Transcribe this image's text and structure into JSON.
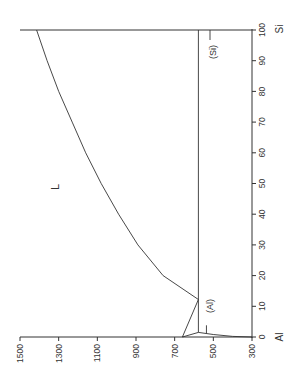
{
  "chart_data": {
    "type": "line",
    "orientation": "rotated 90° (temperature runs horizontally along bottom, composition vertically on right)",
    "xlabel": "Temperature (°C)",
    "ylabel": "Composition (at.% Si)",
    "temperature_axis": {
      "ticks": [
        1500,
        1300,
        1100,
        900,
        700,
        500,
        300
      ],
      "range": [
        300,
        1500
      ]
    },
    "composition_axis": {
      "ticks": [
        0,
        10,
        20,
        30,
        40,
        50,
        60,
        70,
        80,
        90,
        100
      ],
      "range": [
        0,
        100
      ],
      "end_labels": {
        "low": "Al",
        "high": "Si"
      }
    },
    "phase_labels": [
      "L",
      "(Al)",
      "(Si)"
    ],
    "series": [
      {
        "name": "Liquidus (Si side)",
        "points": [
          [
            100,
            1414
          ],
          [
            90,
            1360
          ],
          [
            80,
            1300
          ],
          [
            70,
            1230
          ],
          [
            60,
            1160
          ],
          [
            50,
            1080
          ],
          [
            40,
            990
          ],
          [
            30,
            890
          ],
          [
            20,
            760
          ],
          [
            12.2,
            577
          ]
        ]
      },
      {
        "name": "Liquidus (Al side)",
        "points": [
          [
            0,
            660
          ],
          [
            12.2,
            577
          ]
        ]
      },
      {
        "name": "Solidus (Al)",
        "points": [
          [
            0,
            660
          ],
          [
            1.5,
            577
          ]
        ]
      },
      {
        "name": "Eutectic isotherm",
        "points": [
          [
            1.5,
            577
          ],
          [
            100,
            577
          ]
        ]
      },
      {
        "name": "Solvus (Al)",
        "points": [
          [
            1.5,
            577
          ],
          [
            0.8,
            500
          ],
          [
            0.2,
            400
          ],
          [
            0,
            300
          ]
        ]
      },
      {
        "name": "Si melting line",
        "points": [
          [
            100,
            300
          ],
          [
            100,
            1500
          ]
        ]
      }
    ],
    "key_points": {
      "Al_melting": 660,
      "Si_melting": 1414,
      "eutectic_temp": 577,
      "eutectic_comp": 12.2
    },
    "grid": false,
    "legend": "none"
  },
  "labels": {
    "temp_ticks": [
      "1500",
      "1300",
      "1100",
      "900",
      "700",
      "500",
      "300"
    ],
    "comp_ticks": [
      "0",
      "10",
      "20",
      "30",
      "40",
      "50",
      "60",
      "70",
      "80",
      "90",
      "100"
    ],
    "al": "Al",
    "si": "Si",
    "liquid": "L",
    "al_phase": "(Al)",
    "si_phase": "(Si)"
  }
}
